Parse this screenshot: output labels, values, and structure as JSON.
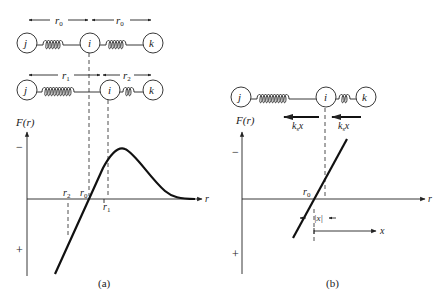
{
  "panel_a": {
    "caption": "(a)",
    "top_chain": {
      "atoms": [
        "j",
        "i",
        "k"
      ],
      "dims": [
        "r0",
        "r0"
      ]
    },
    "bottom_chain": {
      "atoms": [
        "j",
        "i",
        "k"
      ],
      "dims": [
        "r1",
        "r2"
      ]
    },
    "y_axis_label": "F(r)",
    "x_axis_label": "r",
    "sign_minus": "−",
    "sign_plus": "+",
    "markers": {
      "r2": "r",
      "r2_sub": "2",
      "r0": "r",
      "r0_sub": "0",
      "r1": "r",
      "r1_sub": "1"
    }
  },
  "panel_b": {
    "caption": "(b)",
    "chain": {
      "atoms": [
        "j",
        "i",
        "k"
      ]
    },
    "force_labels": {
      "left": "k",
      "left_sub": "s",
      "left_var": "x",
      "right": "k",
      "right_sub": "s",
      "right_var": "x"
    },
    "y_axis_label": "F(r)",
    "x_axis_label": "r",
    "sign_minus": "−",
    "sign_plus": "+",
    "r0": "r",
    "r0_sub": "0",
    "abs_x": "|x|",
    "x_label": "x"
  },
  "colors": {
    "ink": "#222222",
    "background": "#ffffff"
  }
}
